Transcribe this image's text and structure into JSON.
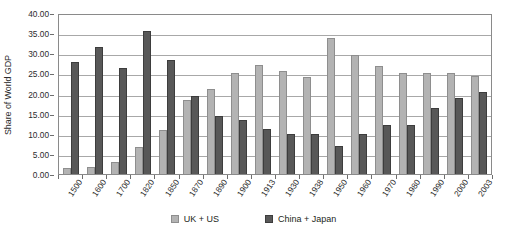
{
  "chart_data": {
    "type": "bar",
    "title": "",
    "subtitle": "",
    "xlabel": "",
    "ylabel": "Share of World GDP",
    "ylim": [
      0,
      40
    ],
    "ytick_step": 5,
    "ytick_labels": [
      "40.00",
      "35.00",
      "30.00",
      "25.00",
      "20.00",
      "15.00",
      "10.00",
      "5.00",
      "0.00"
    ],
    "ytick_values": [
      40,
      35,
      30,
      25,
      20,
      15,
      10,
      5,
      0
    ],
    "grid": "horizontal",
    "legend_position": "bottom",
    "categories": [
      "1500",
      "1600",
      "1700",
      "1820",
      "1850",
      "1870",
      "1890",
      "1900",
      "1913",
      "1930",
      "1938",
      "1950",
      "1960",
      "1970",
      "1980",
      "1990",
      "2000",
      "2003"
    ],
    "series": [
      {
        "name": "UK + US",
        "color": "#b3b3b3",
        "values": [
          1.5,
          1.8,
          3.0,
          6.8,
          11.0,
          18.3,
          21.0,
          25.0,
          27.0,
          25.7,
          24.2,
          33.7,
          29.5,
          26.8,
          25.0,
          25.0,
          25.0,
          24.3
        ]
      },
      {
        "name": "China + Japan",
        "color": "#585858",
        "values": [
          27.8,
          31.5,
          26.3,
          35.6,
          28.3,
          19.3,
          14.3,
          13.5,
          11.3,
          10.0,
          10.0,
          7.0,
          10.0,
          12.3,
          12.3,
          16.3,
          19.0,
          20.3
        ]
      }
    ],
    "annotations": []
  },
  "legend": {
    "items": [
      {
        "label": "UK + US",
        "color": "#b3b3b3"
      },
      {
        "label": "China + Japan",
        "color": "#585858"
      }
    ]
  }
}
